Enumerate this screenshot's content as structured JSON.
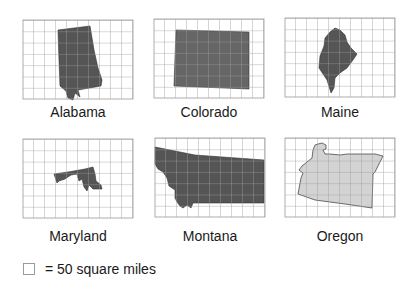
{
  "grid": {
    "columns": 10,
    "rows": 7,
    "cell_size_px": 11,
    "line_color": "#9a9a9a"
  },
  "colors": {
    "dark_fill": "#555555",
    "colorado_fill": "#666666",
    "oregon_fill": "#d3d3d3",
    "outline": "#333333"
  },
  "states": [
    {
      "name": "Alabama"
    },
    {
      "name": "Colorado"
    },
    {
      "name": "Maine"
    },
    {
      "name": "Maryland"
    },
    {
      "name": "Montana"
    },
    {
      "name": "Oregon"
    }
  ],
  "legend": {
    "text": "= 50 square miles"
  }
}
